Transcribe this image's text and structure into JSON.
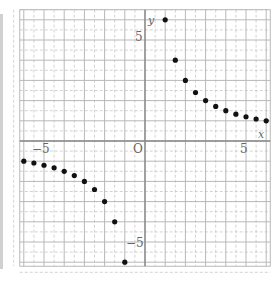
{
  "chart_data": {
    "type": "scatter",
    "title": "",
    "xlabel": "x",
    "ylabel": "y",
    "xlim": [
      -6,
      6
    ],
    "ylim": [
      -6,
      6
    ],
    "grid": {
      "major_step": 1,
      "minor_step": 0.5,
      "minor_style": "dashed"
    },
    "tick_labels": {
      "x": [
        "-5",
        "0",
        "5"
      ],
      "y": [
        "5",
        "-5"
      ]
    },
    "origin_label": "O",
    "function": "y = 6/x",
    "series": [
      {
        "name": "y = 6/x (x > 0)",
        "points": [
          [
            1.0,
            6.0
          ],
          [
            1.5,
            4.0
          ],
          [
            2.0,
            3.0
          ],
          [
            2.5,
            2.4
          ],
          [
            3.0,
            2.0
          ],
          [
            3.5,
            1.71
          ],
          [
            4.0,
            1.5
          ],
          [
            4.5,
            1.33
          ],
          [
            5.0,
            1.2
          ],
          [
            5.5,
            1.09
          ],
          [
            6.0,
            1.0
          ]
        ]
      },
      {
        "name": "y = 6/x (x < 0)",
        "points": [
          [
            -6.0,
            -1.0
          ],
          [
            -5.5,
            -1.09
          ],
          [
            -5.0,
            -1.2
          ],
          [
            -4.5,
            -1.33
          ],
          [
            -4.0,
            -1.5
          ],
          [
            -3.5,
            -1.71
          ],
          [
            -3.0,
            -2.0
          ],
          [
            -2.5,
            -2.4
          ],
          [
            -2.0,
            -3.0
          ],
          [
            -1.5,
            -4.0
          ],
          [
            -1.0,
            -6.0
          ]
        ]
      }
    ],
    "colors": {
      "grid_major": "#b8b8b8",
      "grid_minor": "#c8c8c8",
      "axis": "#888888",
      "point": "#111111",
      "text": "#666666"
    }
  },
  "labels": {
    "x_axis": "x",
    "y_axis": "y",
    "origin": "O",
    "x_neg5": "−5",
    "x_pos5": "5",
    "y_pos5": "5",
    "y_neg5": "−5"
  }
}
